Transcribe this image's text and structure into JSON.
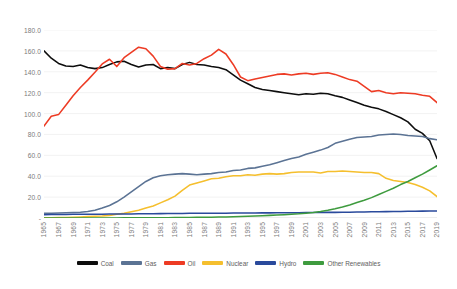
{
  "chart_data": {
    "type": "line",
    "title": "",
    "subtitle": "",
    "xlabel": "",
    "ylabel": "",
    "ylim": [
      0,
      180
    ],
    "xlim": [
      1965,
      2019
    ],
    "grid": true,
    "legend_position": "bottom",
    "ytick_labels": [
      "180.0",
      "160.0",
      "140.0",
      "120.0",
      "100.0",
      "80.0",
      "60.0",
      "40.0",
      "20.0",
      "-"
    ],
    "ytick_values": [
      180,
      160,
      140,
      120,
      100,
      80,
      60,
      40,
      20,
      0
    ],
    "x": [
      1965,
      1966,
      1967,
      1968,
      1969,
      1970,
      1971,
      1972,
      1973,
      1974,
      1975,
      1976,
      1977,
      1978,
      1979,
      1980,
      1981,
      1982,
      1983,
      1984,
      1985,
      1986,
      1987,
      1988,
      1989,
      1990,
      1991,
      1992,
      1993,
      1994,
      1995,
      1996,
      1997,
      1998,
      1999,
      2000,
      2001,
      2002,
      2003,
      2004,
      2005,
      2006,
      2007,
      2008,
      2009,
      2010,
      2011,
      2012,
      2013,
      2014,
      2015,
      2016,
      2017,
      2018,
      2019
    ],
    "xtick_labels": [
      "1965",
      "1967",
      "1969",
      "1971",
      "1973",
      "1975",
      "1977",
      "1979",
      "1981",
      "1983",
      "1985",
      "1987",
      "1989",
      "1991",
      "1993",
      "1995",
      "1997",
      "1999",
      "2001",
      "2003",
      "2005",
      "2007",
      "2009",
      "2011",
      "2013",
      "2015",
      "2017",
      "2019"
    ],
    "series": [
      {
        "name": "Coal",
        "color": "#0d0d0d",
        "values": [
          160.0,
          153.0,
          148.0,
          145.5,
          145.0,
          146.5,
          144.0,
          143.0,
          144.0,
          147.0,
          149.5,
          150.0,
          147.0,
          144.5,
          146.5,
          147.0,
          143.0,
          144.0,
          143.0,
          147.0,
          149.0,
          147.0,
          146.5,
          145.0,
          144.0,
          142.0,
          137.0,
          132.0,
          128.5,
          125.0,
          123.0,
          122.0,
          121.0,
          120.0,
          119.0,
          118.0,
          119.0,
          118.5,
          119.5,
          119.0,
          117.0,
          115.5,
          113.0,
          110.5,
          108.0,
          106.0,
          104.5,
          102.0,
          99.0,
          96.0,
          92.0,
          85.0,
          81.0,
          74.0,
          57.0
        ]
      },
      {
        "name": "Gas",
        "color": "#5b7394",
        "values": [
          4.5,
          4.6,
          4.8,
          5.0,
          5.2,
          5.5,
          6.2,
          7.5,
          9.5,
          12.0,
          15.5,
          20.0,
          25.0,
          30.0,
          35.0,
          38.5,
          40.5,
          41.5,
          42.0,
          42.5,
          42.0,
          41.5,
          42.0,
          42.5,
          43.5,
          44.0,
          45.5,
          46.0,
          47.5,
          48.0,
          49.5,
          51.0,
          53.0,
          55.0,
          57.0,
          58.5,
          61.0,
          63.0,
          65.0,
          67.5,
          71.5,
          73.5,
          75.5,
          77.0,
          77.5,
          78.0,
          79.5,
          80.0,
          80.5,
          80.0,
          79.0,
          78.5,
          78.0,
          76.0,
          75.0
        ]
      },
      {
        "name": "Oil",
        "color": "#ed3b24",
        "values": [
          88.0,
          97.5,
          99.0,
          108.0,
          117.0,
          125.0,
          132.0,
          139.5,
          147.5,
          152.0,
          145.0,
          153.5,
          158.5,
          163.5,
          162.0,
          155.0,
          145.0,
          142.5,
          143.0,
          148.0,
          146.5,
          148.0,
          152.5,
          156.0,
          161.5,
          157.0,
          147.0,
          135.0,
          131.5,
          133.0,
          134.5,
          136.0,
          137.5,
          138.0,
          137.0,
          138.0,
          138.5,
          137.5,
          138.5,
          139.0,
          137.5,
          135.0,
          132.5,
          131.0,
          126.0,
          121.0,
          122.0,
          120.0,
          119.0,
          120.0,
          119.5,
          119.0,
          117.5,
          116.5,
          110.5
        ]
      },
      {
        "name": "Nuclear",
        "color": "#f5bf2e",
        "values": [
          0.2,
          0.3,
          0.4,
          0.5,
          0.8,
          1.0,
          1.3,
          1.7,
          2.0,
          2.5,
          3.5,
          4.5,
          6.0,
          7.5,
          9.5,
          11.5,
          14.5,
          17.5,
          21.0,
          26.5,
          31.5,
          33.5,
          35.5,
          37.5,
          38.0,
          39.5,
          40.5,
          40.5,
          41.5,
          41.0,
          42.0,
          42.5,
          42.0,
          42.5,
          43.5,
          44.0,
          44.0,
          44.0,
          43.0,
          44.5,
          44.5,
          45.0,
          44.5,
          44.0,
          43.5,
          43.5,
          42.5,
          38.0,
          36.0,
          35.0,
          34.0,
          32.0,
          29.5,
          26.0,
          20.5
        ]
      },
      {
        "name": "Hydro",
        "color": "#2a4a9c",
        "values": [
          3.2,
          3.3,
          3.3,
          3.4,
          3.5,
          3.5,
          3.5,
          3.6,
          3.6,
          3.8,
          3.9,
          3.8,
          3.9,
          4.0,
          4.1,
          4.1,
          4.2,
          4.3,
          4.4,
          4.4,
          4.5,
          4.5,
          4.5,
          4.6,
          4.5,
          4.6,
          4.7,
          4.7,
          4.8,
          4.8,
          4.9,
          4.9,
          5.0,
          5.0,
          5.0,
          5.1,
          5.2,
          5.2,
          5.3,
          5.4,
          5.4,
          5.5,
          5.6,
          5.7,
          5.8,
          5.9,
          6.0,
          6.1,
          6.2,
          6.3,
          6.4,
          6.5,
          6.6,
          6.7,
          6.8
        ]
      },
      {
        "name": "Other Renewables",
        "color": "#3e9b3e",
        "values": [
          0.1,
          0.1,
          0.1,
          0.1,
          0.1,
          0.1,
          0.1,
          0.1,
          0.1,
          0.1,
          0.1,
          0.2,
          0.2,
          0.2,
          0.2,
          0.3,
          0.3,
          0.3,
          0.4,
          0.4,
          0.5,
          0.6,
          0.7,
          0.8,
          0.9,
          1.0,
          1.2,
          1.4,
          1.6,
          1.9,
          2.2,
          2.5,
          2.8,
          3.2,
          3.6,
          4.0,
          4.6,
          5.3,
          6.2,
          7.4,
          8.8,
          10.5,
          12.5,
          14.8,
          17.0,
          19.5,
          22.5,
          25.5,
          28.5,
          32.0,
          35.0,
          38.5,
          42.0,
          46.0,
          50.0
        ]
      }
    ]
  },
  "legend": {
    "items": [
      {
        "label": "Coal",
        "color": "#0d0d0d"
      },
      {
        "label": "Gas",
        "color": "#5b7394"
      },
      {
        "label": "Oil",
        "color": "#ed3b24"
      },
      {
        "label": "Nuclear",
        "color": "#f5bf2e"
      },
      {
        "label": "Hydro",
        "color": "#2a4a9c"
      },
      {
        "label": "Other Renewables",
        "color": "#3e9b3e"
      }
    ]
  }
}
